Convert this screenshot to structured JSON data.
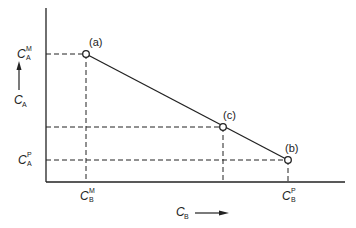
{
  "diagram": {
    "y_axis_label": {
      "main": "C",
      "sub": "A"
    },
    "x_axis_label": {
      "main": "C",
      "sub": "B"
    },
    "ticks_y": [
      {
        "main": "C",
        "sup": "M",
        "sub": "A"
      },
      {
        "main": "C",
        "sup": "P",
        "sub": "A"
      }
    ],
    "ticks_x": [
      {
        "main": "C",
        "sup": "M",
        "sub": "B"
      },
      {
        "main": "C",
        "sup": "P",
        "sub": "B"
      }
    ],
    "points": [
      {
        "label": "(a)",
        "x": 86,
        "y": 54
      },
      {
        "label": "(c)",
        "x": 223,
        "y": 127
      },
      {
        "label": "(b)",
        "x": 288,
        "y": 160
      }
    ],
    "colors": {
      "line": "#222222",
      "background": "#ffffff"
    }
  }
}
